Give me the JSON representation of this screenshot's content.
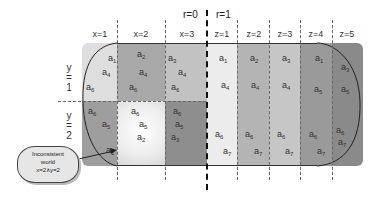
{
  "r_labels": {
    "left": "r=0",
    "right": "r=1"
  },
  "column_headers": [
    "x=1",
    "x=2",
    "x=3",
    "z=1",
    "z=2",
    "z=3",
    "z=4",
    "z=5"
  ],
  "row_labels": [
    {
      "var": "y",
      "eq": "=",
      "val": "1"
    },
    {
      "var": "y",
      "eq": "=",
      "val": "2"
    }
  ],
  "left_grid": {
    "y1": [
      {
        "col": "x=1",
        "items": [
          "a1",
          "a4",
          "a6"
        ]
      },
      {
        "col": "x=2",
        "items": [
          "a2",
          "a4",
          "a6"
        ]
      },
      {
        "col": "x=3",
        "items": [
          "a3",
          "a4",
          "a6"
        ]
      }
    ],
    "y2": [
      {
        "col": "x=1",
        "items": [
          "a6",
          "a5",
          "a1"
        ]
      },
      {
        "col": "x=2",
        "items": [
          "a6",
          "a5",
          "a2"
        ]
      },
      {
        "col": "x=3",
        "items": [
          "a6",
          "a5",
          "a3"
        ]
      }
    ]
  },
  "right_grid": [
    {
      "col": "z=1",
      "items": [
        "a1",
        "a4",
        "a6",
        "a7"
      ]
    },
    {
      "col": "z=2",
      "items": [
        "a2",
        "a4",
        "a6",
        "a7"
      ]
    },
    {
      "col": "z=3",
      "items": [
        "a3",
        "a4",
        "a6",
        "a7"
      ]
    },
    {
      "col": "z=4",
      "items": [
        "a1",
        "a5",
        "a6",
        "a7"
      ]
    },
    {
      "col": "z=5",
      "items": [
        "a3",
        "a5",
        "a6",
        "a7"
      ]
    }
  ],
  "callout": {
    "line1": "Inconsistent",
    "line2": "world",
    "line3": "x=2∧y=2"
  },
  "colors": {
    "x1_y1": "#dedede",
    "x2_y1": "#a8a8a8",
    "x3_y1": "#c2c2c2",
    "x1_y2": "#9e9e9e",
    "x2_y2": "#f2f2f2",
    "x3_y2": "#8e8e8e",
    "z1": "#ececec",
    "z2": "#b4b4b4",
    "z3": "#c6c6c6",
    "z4": "#9a9a9a",
    "z5": "#8a8a8a"
  }
}
